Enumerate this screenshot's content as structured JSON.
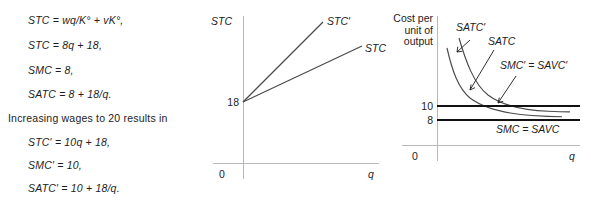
{
  "equations": {
    "block1": [
      {
        "text": "STC  =  wq/K°  +  vK°,",
        "top": 14
      },
      {
        "text": "STC  =  8q  +  18,",
        "top": 39
      },
      {
        "text": "SMC  =  8,",
        "top": 64
      },
      {
        "text": "SATC  =  8  +  18/q.",
        "top": 88
      }
    ],
    "intro": {
      "text": "Increasing wages to 20 results in",
      "top": 112
    },
    "block2": [
      {
        "text": "STC′  =  10q  +  18,",
        "top": 136
      },
      {
        "text": "SMC′  =  10,",
        "top": 159
      },
      {
        "text": "SATC′  =  10  +  18/q.",
        "top": 182
      }
    ]
  },
  "chart_stc": {
    "type": "line",
    "title": "",
    "ylabel": "STC",
    "xlabel": "q",
    "origin_label": "0",
    "yticks": [
      {
        "label": "18",
        "value": 18
      }
    ],
    "xlim": [
      0,
      10
    ],
    "ylim": [
      0,
      120
    ],
    "grid": false,
    "series": [
      {
        "name": "STC′",
        "label": "STC′",
        "intercept": 18,
        "slope": 10,
        "points": [
          [
            0,
            18
          ],
          [
            7.8,
            96
          ]
        ]
      },
      {
        "name": "STC",
        "label": "STC",
        "intercept": 18,
        "slope": 8,
        "points": [
          [
            0,
            18
          ],
          [
            9.6,
            95
          ]
        ]
      }
    ]
  },
  "chart_cost": {
    "type": "line",
    "title": "",
    "ylabel": "Cost per\nunit of\noutput",
    "ylabel_lines": [
      "Cost per",
      "unit of",
      "output"
    ],
    "xlabel": "q",
    "origin_label": "0",
    "yticks": [
      {
        "label": "10",
        "value": 10
      },
      {
        "label": "8",
        "value": 8
      }
    ],
    "xlim": [
      0,
      10
    ],
    "ylim": [
      0,
      26
    ],
    "grid": false,
    "series": [
      {
        "name": "SATC′",
        "label": "SATC′",
        "kind": "hyperbola",
        "formula": "10 + 18/q",
        "asymptote": 10
      },
      {
        "name": "SATC",
        "label": "SATC",
        "kind": "hyperbola",
        "formula": "8 + 18/q",
        "asymptote": 8
      },
      {
        "name": "SMC′ = SAVC′",
        "label": "SMC′ = SAVC′",
        "kind": "horizontal",
        "value": 10
      },
      {
        "name": "SMC = SAVC",
        "label": "SMC = SAVC",
        "kind": "horizontal",
        "value": 8
      }
    ],
    "annotations": [
      {
        "label": "SATC′",
        "x": 456,
        "y": 28
      },
      {
        "label": "SATC",
        "x": 488,
        "y": 42
      },
      {
        "label": "SMC′ = SAVC′",
        "x": 500,
        "y": 66
      },
      {
        "label": "SMC = SAVC",
        "x": 496,
        "y": 122
      }
    ]
  },
  "colors": {
    "background": "#ffffff",
    "text": "#1c1c1c",
    "curve": "#4a4a4a",
    "thick_line": "#111111",
    "axis": "#b9b9b9"
  }
}
